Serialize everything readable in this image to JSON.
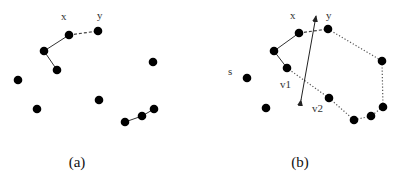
{
  "figure": {
    "panels": [
      {
        "id": "a",
        "caption": "(a)",
        "caption_pos": [
          77,
          167
        ],
        "labels": [
          {
            "text": "x",
            "x": 61,
            "y": 20
          },
          {
            "text": "y",
            "x": 97,
            "y": 19
          }
        ],
        "nodes": [
          {
            "id": "x",
            "x": 69,
            "y": 35
          },
          {
            "id": "y",
            "x": 98,
            "y": 31
          },
          {
            "id": "n1",
            "x": 44,
            "y": 51
          },
          {
            "id": "n2",
            "x": 57,
            "y": 70
          },
          {
            "id": "n3",
            "x": 18,
            "y": 80
          },
          {
            "id": "n4",
            "x": 37,
            "y": 109
          },
          {
            "id": "n5",
            "x": 99,
            "y": 100
          },
          {
            "id": "n6",
            "x": 153,
            "y": 62
          },
          {
            "id": "n7",
            "x": 125,
            "y": 122
          },
          {
            "id": "n8",
            "x": 142,
            "y": 116
          },
          {
            "id": "n9",
            "x": 154,
            "y": 109
          }
        ],
        "edges": [
          {
            "from": "x",
            "to": "n1",
            "style": "solid"
          },
          {
            "from": "n1",
            "to": "n2",
            "style": "solid"
          },
          {
            "from": "x",
            "to": "y",
            "style": "dashed"
          },
          {
            "from": "n7",
            "to": "n8",
            "style": "solid"
          },
          {
            "from": "n8",
            "to": "n9",
            "style": "solid"
          }
        ]
      },
      {
        "id": "b",
        "caption": "(b)",
        "caption_pos": [
          300,
          167
        ],
        "labels": [
          {
            "text": "x",
            "x": 290,
            "y": 19
          },
          {
            "text": "y",
            "x": 326,
            "y": 19
          },
          {
            "text": "s",
            "x": 228,
            "y": 75
          },
          {
            "text": "v1",
            "x": 280,
            "y": 88
          },
          {
            "text": "v2",
            "x": 312,
            "y": 112
          }
        ],
        "nodes": [
          {
            "id": "x",
            "x": 299,
            "y": 33
          },
          {
            "id": "y",
            "x": 328,
            "y": 29
          },
          {
            "id": "n1",
            "x": 274,
            "y": 51
          },
          {
            "id": "v1",
            "x": 287,
            "y": 68
          },
          {
            "id": "s",
            "x": 247,
            "y": 78
          },
          {
            "id": "n4",
            "x": 266,
            "y": 108
          },
          {
            "id": "v2",
            "x": 329,
            "y": 98
          },
          {
            "id": "n7",
            "x": 354,
            "y": 120
          },
          {
            "id": "n8",
            "x": 371,
            "y": 116
          },
          {
            "id": "n9",
            "x": 383,
            "y": 107
          },
          {
            "id": "n10",
            "x": 382,
            "y": 61
          }
        ],
        "edges": [
          {
            "from": "x",
            "to": "n1",
            "style": "solid"
          },
          {
            "from": "n1",
            "to": "v1",
            "style": "solid"
          },
          {
            "from": "x",
            "to": "y",
            "style": "dashed"
          },
          {
            "from": "y",
            "to": "n10",
            "style": "dotted"
          },
          {
            "from": "n10",
            "to": "n9",
            "style": "dotted"
          },
          {
            "from": "n9",
            "to": "n8",
            "style": "dotted"
          },
          {
            "from": "n8",
            "to": "n7",
            "style": "dotted"
          },
          {
            "from": "n7",
            "to": "v2",
            "style": "dotted"
          },
          {
            "from": "v2",
            "to": "v1",
            "style": "dotted"
          }
        ],
        "arrow": {
          "x1": 301,
          "y1": 100,
          "x2": 316,
          "y2": 16,
          "double_headed": true
        }
      }
    ]
  }
}
